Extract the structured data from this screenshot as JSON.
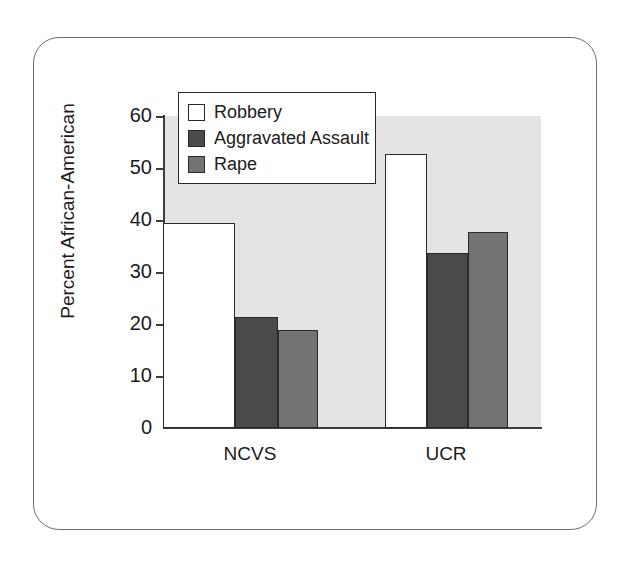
{
  "chart_data": {
    "type": "bar",
    "title": "",
    "subtitle": "",
    "xlabel": "",
    "ylabel": "Percent African-American",
    "categories": [
      "NCVS",
      "UCR"
    ],
    "series": [
      {
        "name": "Robbery",
        "values": [
          39.5,
          52.7
        ],
        "color": "#ffffff"
      },
      {
        "name": "Aggravated Assault",
        "values": [
          21.3,
          33.7
        ],
        "color": "#4a4a4a"
      },
      {
        "name": "Rape",
        "values": [
          18.9,
          37.6
        ],
        "color": "#737373"
      }
    ],
    "ylim": [
      0,
      60
    ],
    "yticks": [
      0,
      10,
      20,
      30,
      40,
      50,
      60
    ],
    "ytick_labels": [
      "0",
      "10",
      "20",
      "30",
      "40",
      "50",
      "60"
    ],
    "grid": false,
    "legend_position": "top-left",
    "plot_background": "#e4e4e4",
    "axis_color": "#3c3c3c",
    "bar_edge_color": "#2a2a2a"
  },
  "legend": {
    "items": [
      {
        "label": "Robbery",
        "color": "#ffffff"
      },
      {
        "label": "Aggravated Assault",
        "color": "#4a4a4a"
      },
      {
        "label": "Rape",
        "color": "#737373"
      }
    ]
  },
  "axes": {
    "y_title": "Percent African-American",
    "y_tick_0": "0",
    "y_tick_1": "10",
    "y_tick_2": "20",
    "y_tick_3": "30",
    "y_tick_4": "40",
    "y_tick_5": "50",
    "y_tick_6": "60",
    "x_cat_0": "NCVS",
    "x_cat_1": "UCR"
  }
}
